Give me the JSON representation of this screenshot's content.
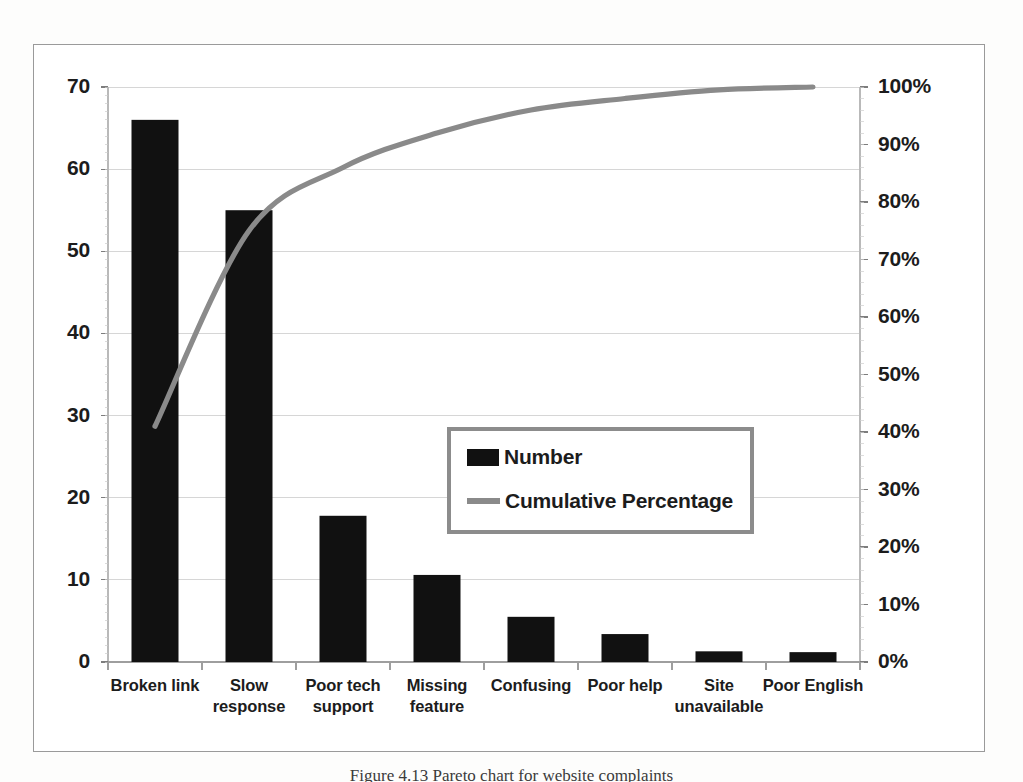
{
  "figure": {
    "caption": "Figure 4.13  Pareto chart for website complaints"
  },
  "legend": {
    "position": "inside-center",
    "border_color": "#8c8c8c",
    "entries": [
      {
        "label": "Number",
        "marker": "bar-swatch",
        "color": "#111111"
      },
      {
        "label": "Cumulative Percentage",
        "marker": "line-swatch",
        "color": "#8a8a8a"
      }
    ]
  },
  "axes": {
    "left": {
      "ticks": [
        "0",
        "10",
        "20",
        "30",
        "40",
        "50",
        "60",
        "70"
      ],
      "min": 0,
      "max": 70,
      "step": 10
    },
    "right": {
      "ticks": [
        "0%",
        "10%",
        "20%",
        "30%",
        "40%",
        "50%",
        "60%",
        "70%",
        "80%",
        "90%",
        "100%"
      ],
      "min": 0,
      "max": 100,
      "step": 10
    }
  },
  "chart_data": {
    "type": "bar",
    "title": "",
    "subtitle": "",
    "xlabel": "",
    "ylabel": "",
    "y2label": "",
    "categories": [
      "Broken link",
      "Slow response",
      "Poor tech support",
      "Missing feature",
      "Confusing",
      "Poor help",
      "Site unavailable",
      "Poor English"
    ],
    "series": [
      {
        "name": "Number",
        "type": "bar",
        "axis": "left",
        "color": "#111111",
        "values": [
          66,
          55,
          17.8,
          10.6,
          5.5,
          3.4,
          1.3,
          1.2
        ]
      },
      {
        "name": "Cumulative Percentage",
        "type": "line",
        "axis": "right",
        "color": "#8a8a8a",
        "values": [
          41,
          75,
          86,
          92,
          96,
          98,
          99.5,
          100
        ]
      }
    ],
    "ylim": [
      0,
      70
    ],
    "y2lim": [
      0,
      100
    ],
    "grid": true,
    "grid_color": "#d2d2d2",
    "legend_position": "center"
  }
}
